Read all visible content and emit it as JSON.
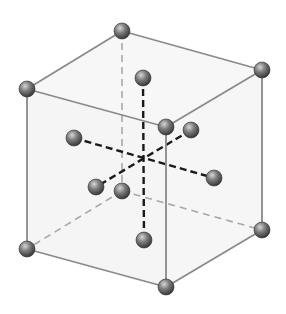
{
  "diagram": {
    "type": "crystal-unit-cell",
    "colors": {
      "background": "#ffffff",
      "cube_fill": "#ededed",
      "edge_visible": "#8a8a8a",
      "edge_hidden": "#a8a8a8",
      "axis_dashed": "#1a1a1a",
      "atom_light": "#c9c9c9",
      "atom_mid": "#7a7a7a",
      "atom_dark": "#3a3a3a"
    },
    "corners": {
      "front_top_left": [
        27,
        89
      ],
      "front_top_right": [
        166,
        127
      ],
      "front_bottom_left": [
        27,
        249
      ],
      "front_bottom_right": [
        166,
        287
      ],
      "back_top_left": [
        122,
        31
      ],
      "back_top_right": [
        262,
        70
      ],
      "back_bottom_left": [
        122,
        191
      ],
      "back_bottom_right": [
        262,
        230
      ]
    },
    "face_atoms": {
      "top": [
        143,
        78
      ],
      "bottom": [
        144,
        240
      ],
      "left": [
        74,
        138
      ],
      "right": [
        214,
        178
      ],
      "back": [
        191,
        130
      ],
      "front": [
        96,
        187
      ]
    },
    "center": [
      144,
      159
    ],
    "atom_radius": 8
  }
}
